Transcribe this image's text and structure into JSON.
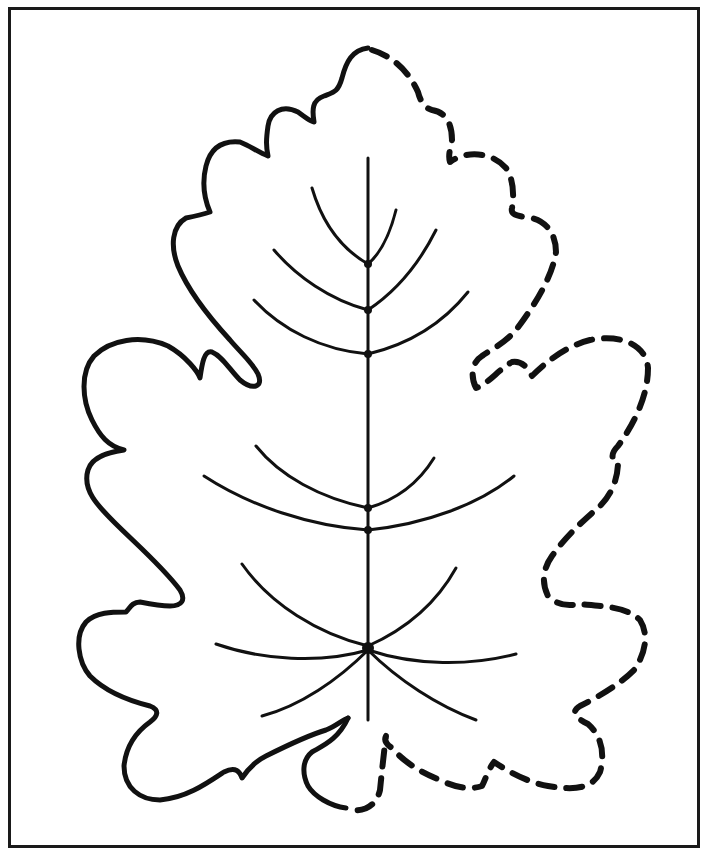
{
  "worksheet": {
    "subject": "leaf tracing / coloring page",
    "left_half": "solid outline",
    "right_half": "dashed outline (to trace)",
    "stroke_color": "#111111",
    "background_color": "#ffffff",
    "frame_color": "#1a1a1a"
  }
}
